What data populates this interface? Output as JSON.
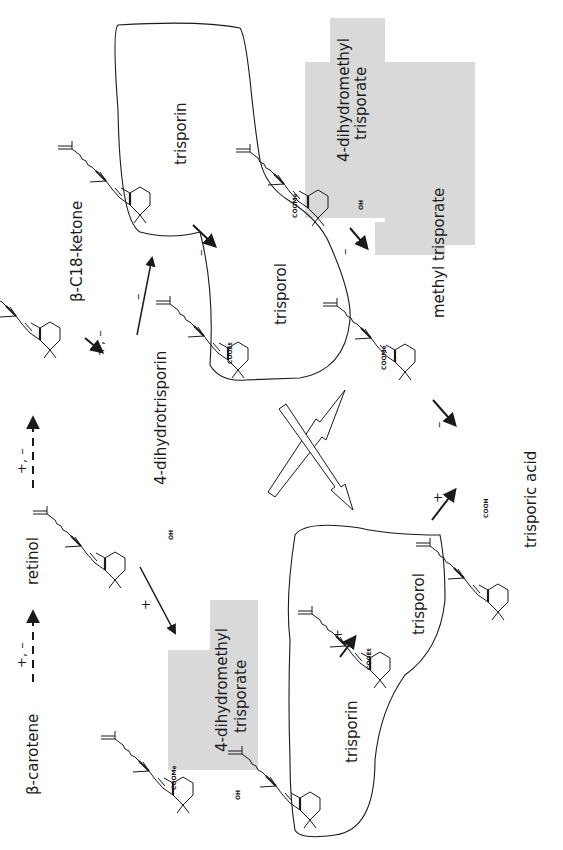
{
  "diagram": {
    "orientation": "rotated-90-ccw",
    "colors": {
      "line": "#1a1a1a",
      "shade": "#d9d9d9",
      "background": "#ffffff"
    },
    "compounds": {
      "beta_carotene": "β-carotene",
      "retinol": "retinol",
      "beta_c18_ketone": "β-C18-ketone",
      "dihydrotrisporin": "4-dihydrotrisporin",
      "trisporin_top": "trisporin",
      "trisporol_top": "trisporol",
      "dihydromethyl_trisporate_top_l1": "4-dihydromethyl",
      "dihydromethyl_trisporate_top_l2": "trisporate",
      "methyl_trisporate": "methyl trisporate",
      "trisporic_acid": "trisporic acid",
      "dihydromethyl_trisporate_bottom_l1": "4-dihydromethyl",
      "dihydromethyl_trisporate_bottom_l2": "trisporate",
      "trisporin_bottom": "trisporin",
      "trisporol_bottom": "trisporol"
    },
    "substituents": {
      "cooet": "COOEt",
      "coome": "COOMe",
      "cooh": "COOH",
      "oh": "OH",
      "o": "O",
      "c14": "14"
    },
    "arrow_signs": {
      "carotene_to_retinol": "+, –",
      "retinol_to_ketone": "+, –",
      "ketone_to_dihydrotrisporin": "+, –",
      "dihydrotrisporin_to_trisporin": "–",
      "trisporin_to_trisporol": "–",
      "dihydrotrisporin_to_dmt": "+",
      "dmt_to_methyl_trisporate": "–",
      "methyl_trisporate_to_acid": "–",
      "trisporol_to_acid": "+",
      "trisporin_to_trisporol_bottom": "+"
    },
    "groups": [
      {
        "name": "minus-strain-group",
        "members": [
          "trisporin",
          "trisporol"
        ],
        "style": "outlined"
      },
      {
        "name": "plus-strain-group",
        "members": [
          "trisporin",
          "trisporol"
        ],
        "style": "outlined"
      },
      {
        "name": "methyl-esters-top",
        "members": [
          "4-dihydromethyl trisporate",
          "methyl trisporate"
        ],
        "style": "shaded"
      },
      {
        "name": "methyl-ester-bottom",
        "members": [
          "4-dihydromethyl trisporate"
        ],
        "style": "shaded"
      }
    ]
  }
}
